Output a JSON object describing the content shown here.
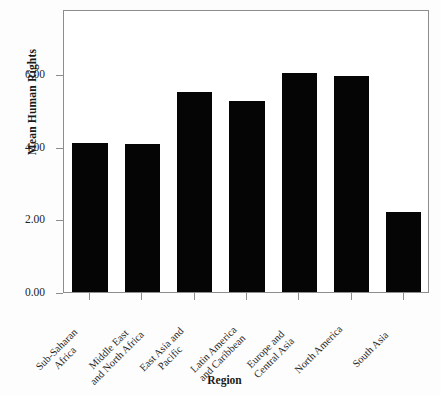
{
  "chart_data": {
    "type": "bar",
    "title": "",
    "xlabel": "Region",
    "ylabel": "Mean Human Rights",
    "categories": [
      "Sub-Saharan Africa",
      "Middle East and North Africa",
      "East Asia and Pacific",
      "Latin America and Caribbean",
      "Europe and Central Asia",
      "North America",
      "South Asia"
    ],
    "category_lines": [
      [
        "Sub-Saharan",
        "Africa"
      ],
      [
        "Middle East",
        "and North Africa"
      ],
      [
        "East Asia and",
        "Pacific"
      ],
      [
        "Latin America",
        "and Caribbean"
      ],
      [
        "Europe and",
        "Central Asia"
      ],
      [
        "North America"
      ],
      [
        "South Asia"
      ]
    ],
    "values": [
      4.1,
      4.07,
      5.5,
      5.27,
      6.05,
      5.95,
      2.2
    ],
    "ylim": [
      0,
      7.8
    ],
    "yticks": [
      0,
      2,
      4,
      6
    ],
    "ytick_labels": [
      "0.00",
      "2.00",
      "4.00",
      "6.00"
    ],
    "grid": false,
    "legend": null,
    "bar_color": "#050505",
    "frame_color": "#8d8d8d",
    "background": "#ffffff"
  },
  "axes": {
    "y_title": "Mean Human Rights",
    "x_title": "Region"
  }
}
